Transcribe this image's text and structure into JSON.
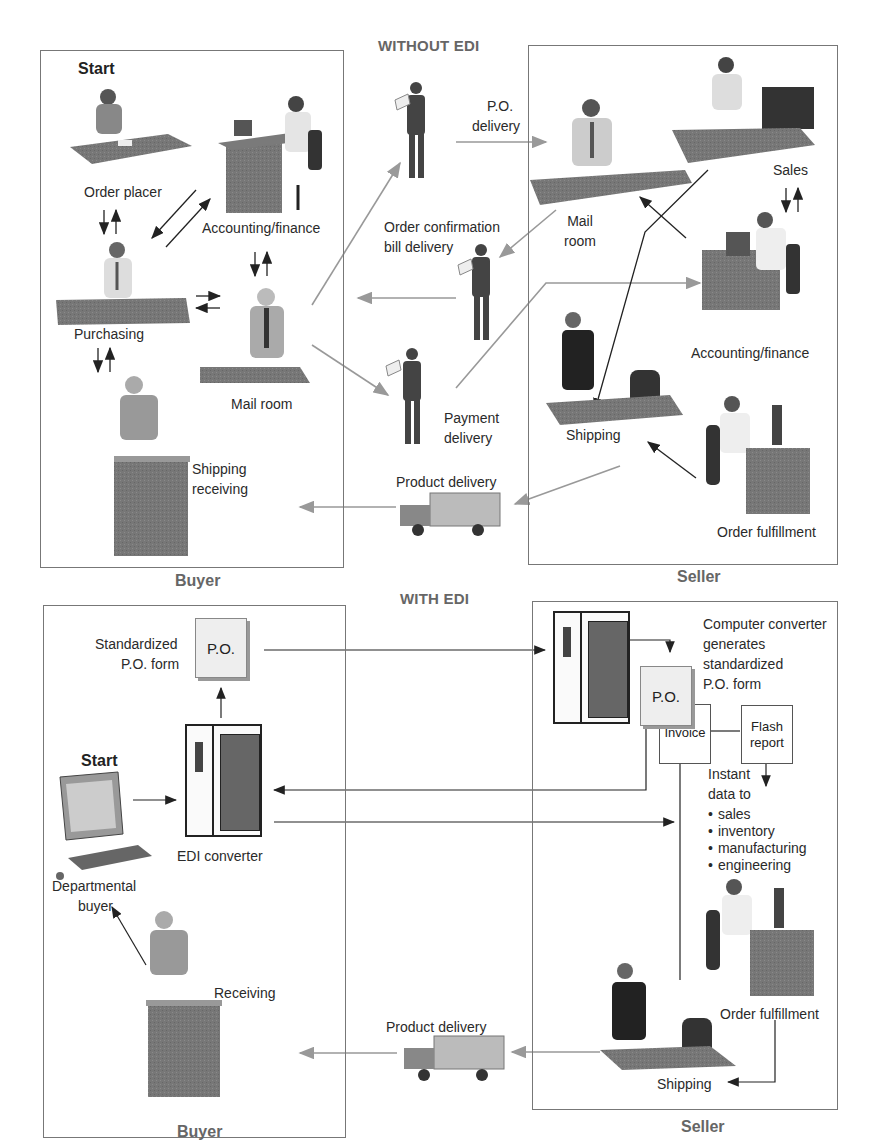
{
  "without_edi": {
    "title": "WITHOUT EDI",
    "buyer": {
      "label": "Buyer",
      "start": "Start",
      "nodes": {
        "order_placer": "Order placer",
        "accounting": "Accounting/finance",
        "purchasing": "Purchasing",
        "mail_room": "Mail room",
        "shipping_receiving_1": "Shipping",
        "shipping_receiving_2": "receiving"
      }
    },
    "transit": {
      "po_delivery_1": "P.O.",
      "po_delivery_2": "delivery",
      "order_conf_1": "Order confirmation",
      "order_conf_2": "bill delivery",
      "payment_1": "Payment",
      "payment_2": "delivery",
      "product_delivery": "Product delivery"
    },
    "seller": {
      "label": "Seller",
      "nodes": {
        "mail_room_1": "Mail",
        "mail_room_2": "room",
        "sales": "Sales",
        "accounting": "Accounting/finance",
        "shipping": "Shipping",
        "order_fulfillment": "Order fulfillment"
      }
    }
  },
  "with_edi": {
    "title": "WITH EDI",
    "buyer": {
      "label": "Buyer",
      "start": "Start",
      "nodes": {
        "std_po_1": "Standardized",
        "std_po_2": "P.O. form",
        "po_doc": "P.O.",
        "edi_converter": "EDI converter",
        "dept_buyer_1": "Departmental",
        "dept_buyer_2": "buyer",
        "receiving": "Receiving"
      }
    },
    "transit": {
      "product_delivery": "Product delivery"
    },
    "seller": {
      "label": "Seller",
      "nodes": {
        "converter_1": "Computer converter",
        "converter_2": "generates",
        "converter_3": "standardized",
        "converter_4": "P.O. form",
        "po_doc": "P.O.",
        "invoice": "Invoice",
        "flash_1": "Flash",
        "flash_2": "report",
        "instant_1": "Instant",
        "instant_2": "data to",
        "recipients": [
          "sales",
          "inventory",
          "manufacturing",
          "engineering"
        ],
        "order_fulfillment": "Order fulfillment",
        "shipping": "Shipping"
      }
    }
  },
  "colors": {
    "frame": "#777777",
    "title_gray": "#666666",
    "arrow_dark": "#222222",
    "arrow_gray": "#999999"
  }
}
